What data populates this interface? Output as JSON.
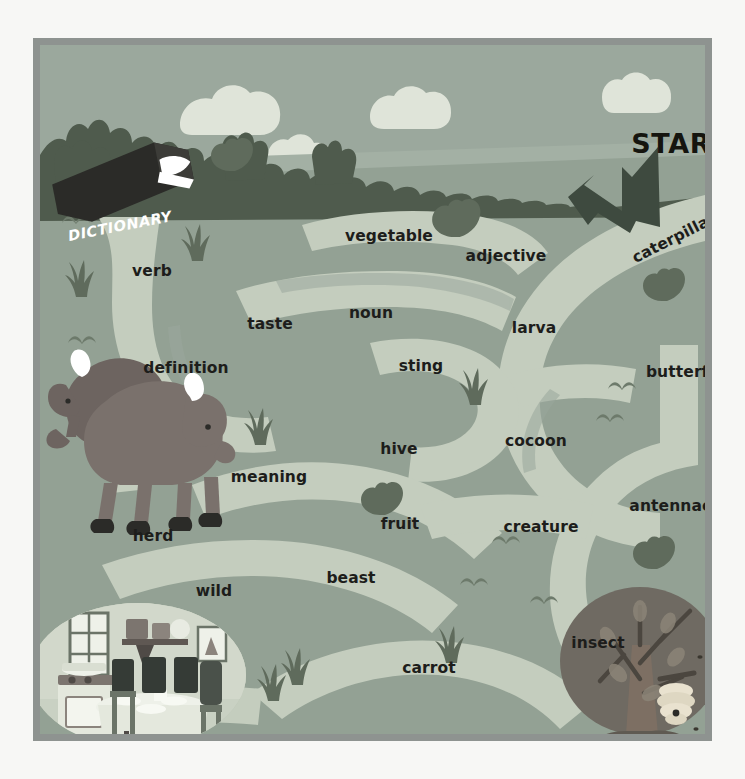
{
  "page": {
    "background_color": "#f7f7f5"
  },
  "frame": {
    "border_color": "#8e9390",
    "field_color": "#9aa79c"
  },
  "palette": {
    "sky": "#9ba89d",
    "cloud": "#dfe4d9",
    "ground_far": "#a3b0a4",
    "ground_near": "#93a194",
    "maze_path": "#c4cdbe",
    "maze_wall": "#9aa79c",
    "foliage_dark": "#5f6b5c",
    "treeline": "#4f5b4d",
    "animal": "#6d6460",
    "text_dark": "#1d1d1b",
    "book_cover": "#2b2b28",
    "book_pages": "#ffffff"
  },
  "markers": {
    "start": {
      "label": "START",
      "x": 640,
      "y": 98
    },
    "end": {
      "label": "END",
      "x": 600,
      "y": 705
    }
  },
  "book": {
    "label": "DICTIONARY",
    "x": 80,
    "y": 181
  },
  "words": [
    {
      "label": "vegetable",
      "x": 349,
      "y": 191,
      "rotate": 0
    },
    {
      "label": "adjective",
      "x": 466,
      "y": 211,
      "rotate": 0
    },
    {
      "label": "caterpillar",
      "x": 634,
      "y": 193,
      "rotate": -27
    },
    {
      "label": "verb",
      "x": 112,
      "y": 226,
      "rotate": 0
    },
    {
      "label": "noun",
      "x": 331,
      "y": 268,
      "rotate": 0
    },
    {
      "label": "larva",
      "x": 494,
      "y": 283,
      "rotate": 0
    },
    {
      "label": "taste",
      "x": 230,
      "y": 279,
      "rotate": 0
    },
    {
      "label": "definition",
      "x": 146,
      "y": 323,
      "rotate": 0
    },
    {
      "label": "sting",
      "x": 381,
      "y": 321,
      "rotate": 0
    },
    {
      "label": "butterfly",
      "x": 645,
      "y": 327,
      "rotate": 0
    },
    {
      "label": "hive",
      "x": 359,
      "y": 404,
      "rotate": 0
    },
    {
      "label": "cocoon",
      "x": 496,
      "y": 396,
      "rotate": 0
    },
    {
      "label": "meaning",
      "x": 229,
      "y": 432,
      "rotate": 0
    },
    {
      "label": "fruit",
      "x": 360,
      "y": 479,
      "rotate": 0
    },
    {
      "label": "creature",
      "x": 501,
      "y": 482,
      "rotate": 0
    },
    {
      "label": "antennae",
      "x": 631,
      "y": 461,
      "rotate": 0
    },
    {
      "label": "herd",
      "x": 113,
      "y": 491,
      "rotate": 0
    },
    {
      "label": "beast",
      "x": 311,
      "y": 533,
      "rotate": 0
    },
    {
      "label": "wild",
      "x": 174,
      "y": 546,
      "rotate": 0
    },
    {
      "label": "insect",
      "x": 558,
      "y": 598,
      "rotate": 0
    },
    {
      "label": "carrot",
      "x": 389,
      "y": 623,
      "rotate": 0
    },
    {
      "label": "bread",
      "x": 276,
      "y": 713,
      "rotate": 0
    }
  ],
  "scenery": {
    "dictionary_book": "dictionary-book-icon",
    "bison_herd": "bison-herd-illustration",
    "kitchen_scene": "kitchen-dining-scene-illustration",
    "tree_with_beehive": "tree-beehive-illustration",
    "clouds": 4,
    "grass_tufts": 7,
    "bush_clusters": 5,
    "bird_marks": 6
  }
}
